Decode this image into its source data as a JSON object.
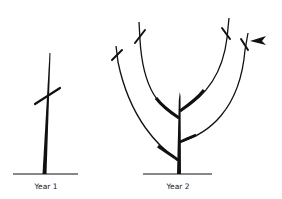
{
  "diagram": {
    "title": "",
    "panels": [
      {
        "id": "year1",
        "label": "Year 1",
        "cuts": 1,
        "branches": 0
      },
      {
        "id": "year2",
        "label": "Year 2",
        "cuts": 4,
        "branches": 4,
        "arrow_marks": "outer-right-cut"
      }
    ],
    "colors": {
      "ink": "#111111",
      "background": "#ffffff"
    }
  }
}
